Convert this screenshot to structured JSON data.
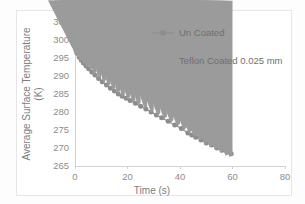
{
  "chart_data": {
    "type": "scatter",
    "title": "",
    "xlabel": "Time (s)",
    "ylabel": "Average Surface Temperature (K)",
    "ylabel_line1": "Average Surface Temperature",
    "ylabel_line2": "(K)",
    "xlim": [
      0,
      80
    ],
    "ylim": [
      265,
      305
    ],
    "xticks": [
      0,
      20,
      40,
      60,
      80
    ],
    "yticks": [
      265,
      270,
      275,
      280,
      285,
      290,
      295,
      300,
      305
    ],
    "xtick_labels": [
      "0",
      "20",
      "40",
      "60",
      "80"
    ],
    "ytick_labels": [
      "265",
      "270",
      "275",
      "280",
      "285",
      "290",
      "295",
      "300",
      "305"
    ],
    "grid": false,
    "legend_position": "upper right",
    "marker_color": "#8d8d8d",
    "line_color": "#8f8f8f",
    "axis_color": "#d2d2d2",
    "series": [
      {
        "name": "Un Coated",
        "marker": "circle",
        "line": true,
        "x": [
          0.0,
          0.8,
          1.6,
          2.4,
          3.2,
          4.2,
          5.2,
          6.4,
          7.6,
          9.0,
          10.4,
          12.0,
          13.5,
          15.0,
          16.5,
          18.0,
          19.5,
          21.0,
          23.0,
          25.0,
          27.0,
          29.0,
          31.0,
          33.0,
          35.5,
          38.0,
          40.5,
          43.0,
          44.5,
          46.0,
          48.0,
          50.0,
          52.0,
          54.0,
          56.0,
          58.0,
          59.5
        ],
        "y": [
          298.5,
          296.3,
          295.2,
          294.4,
          293.6,
          292.8,
          292.0,
          291.1,
          290.3,
          289.3,
          288.4,
          287.5,
          286.6,
          285.8,
          285.0,
          284.4,
          283.8,
          283.2,
          282.4,
          281.6,
          280.8,
          280.0,
          279.2,
          278.4,
          277.4,
          276.4,
          275.4,
          274.2,
          273.6,
          273.0,
          272.2,
          271.4,
          270.8,
          270.0,
          269.4,
          268.8,
          268.4
        ]
      },
      {
        "name": "Teflon Coated 0.025 mm",
        "marker": "triangle",
        "line": false,
        "x": [
          0.0,
          1.0,
          2.0,
          3.0,
          4.2,
          5.4,
          6.8,
          8.2,
          10.0,
          11.8,
          13.6,
          15.4,
          17.2,
          19.0,
          21.0,
          23.0,
          25.0,
          27.5,
          30.0,
          32.5,
          35.0,
          37.5,
          40.0,
          42.5,
          44.5,
          46.5,
          48.5,
          50.5,
          52.5,
          54.5,
          56.5,
          58.5,
          60.0
        ],
        "y": [
          297.8,
          296.0,
          294.9,
          294.0,
          293.2,
          292.3,
          291.4,
          290.4,
          289.2,
          288.1,
          287.0,
          286.0,
          285.1,
          284.2,
          283.4,
          282.6,
          281.8,
          280.8,
          279.8,
          278.9,
          278.0,
          277.0,
          276.0,
          274.9,
          274.0,
          273.0,
          272.0,
          271.0,
          270.2,
          269.4,
          268.6,
          267.8,
          267.4
        ]
      }
    ],
    "legend": [
      {
        "label": "Un Coated",
        "marker": "circle",
        "line": true
      },
      {
        "label": "Teflon Coated 0.025 mm",
        "marker": "triangle",
        "line": false
      }
    ]
  }
}
